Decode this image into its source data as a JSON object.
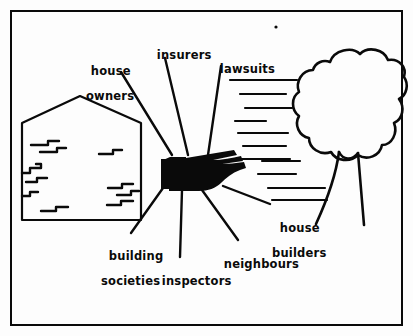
{
  "figure": {
    "kind": "line-drawing-diagram",
    "background_color": "#fdfdfd",
    "ink_color": "#0a0a0a",
    "border": {
      "name": "frame",
      "inset_px": 10,
      "stroke_width": 2
    }
  },
  "labels": [
    {
      "id": "house-owners",
      "line1": "house",
      "line2": "owners",
      "x": 74,
      "y": 52,
      "indent": true
    },
    {
      "id": "insurers",
      "line1": "insurers",
      "line2": "",
      "x": 140,
      "y": 36,
      "indent": false
    },
    {
      "id": "lawsuits",
      "line1": "lawsuits",
      "line2": "",
      "x": 203,
      "y": 50,
      "indent": false
    },
    {
      "id": "house-builders",
      "line1": "house",
      "line2": "builders",
      "x": 263,
      "y": 209,
      "indent": true
    },
    {
      "id": "neighbours",
      "line1": "neighbours",
      "line2": "",
      "x": 207,
      "y": 245,
      "indent": false
    },
    {
      "id": "inspectors",
      "line1": "inspectors",
      "line2": "",
      "x": 145,
      "y": 262,
      "indent": false
    },
    {
      "id": "building-societies",
      "line1": "building",
      "line2": "societies",
      "x": 92,
      "y": 237,
      "indent": true
    }
  ],
  "elements": {
    "hand": {
      "name": "pointing-hand",
      "fill": "#0a0a0a",
      "points_direction": "right"
    },
    "house": {
      "name": "cracked-house",
      "shape": "pentagon-gable",
      "crack_count": 10
    },
    "tree": {
      "name": "tree",
      "canopy": "lobed-cloud",
      "trunk_roots": 2
    },
    "motion_lines": {
      "name": "motion-lines",
      "count": 11,
      "orientation": "horizontal"
    },
    "radial_lines": {
      "name": "leader-lines",
      "count": 7
    },
    "ink_speck": {
      "name": "ink-speck",
      "x": 276,
      "y": 27
    }
  }
}
